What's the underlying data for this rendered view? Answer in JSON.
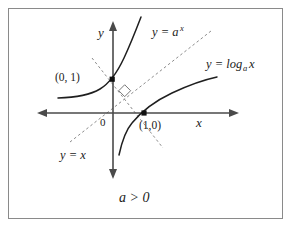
{
  "figure": {
    "caption": "a > 0",
    "axes": {
      "x_label": "x",
      "y_label": "y",
      "origin_label": "0"
    },
    "curves": [
      {
        "name": "exponential",
        "label": "y = a",
        "label_exponent": "x",
        "label_full": "y = a^x",
        "passes_through": "(0, 1)"
      },
      {
        "name": "logarithm",
        "label_prefix": "y = log",
        "label_subscript": "a",
        "label_suffix": "x",
        "label_full": "y = log_a x",
        "passes_through": "(1,0)"
      },
      {
        "name": "identity-line",
        "label": "y = x",
        "style": "dashed"
      }
    ],
    "points": [
      {
        "name": "y-intercept",
        "label": "(0, 1)"
      },
      {
        "name": "x-intercept",
        "label": "(1,0)"
      }
    ],
    "markers": [
      {
        "name": "right-angle-marker",
        "shape": "diamond"
      }
    ],
    "colors": {
      "curve": "#1f1f1f",
      "axis": "#4a4a4a",
      "dashed": "#8c8c8c",
      "frame": "#8a8a8a",
      "text": "#1b1b1b",
      "background": "#ffffff"
    }
  }
}
